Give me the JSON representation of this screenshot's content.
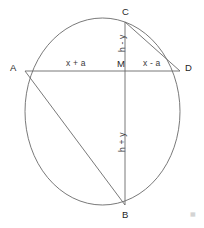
{
  "figure": {
    "stroke_color": "#555555",
    "background_color": "#ffffff",
    "label_color": "#2b2b2b",
    "vertices": [
      {
        "id": "A",
        "label": "A",
        "x": 25,
        "y": 71
      },
      {
        "id": "C",
        "label": "C",
        "x": 125,
        "y": 22
      },
      {
        "id": "D",
        "label": "D",
        "x": 180,
        "y": 71
      },
      {
        "id": "M",
        "label": "M",
        "x": 125,
        "y": 71
      },
      {
        "id": "B",
        "label": "B",
        "x": 125,
        "y": 205
      }
    ],
    "segments": [
      {
        "id": "AD",
        "from": "A",
        "to": "D"
      },
      {
        "id": "CB",
        "from": "C",
        "to": "B"
      },
      {
        "id": "AB",
        "from": "A",
        "to": "B"
      },
      {
        "id": "CD",
        "from": "C",
        "to": "D"
      }
    ],
    "segment_labels": [
      {
        "id": "AM",
        "text": "x + a",
        "orientation": "horizontal"
      },
      {
        "id": "MD",
        "text": "x - a",
        "orientation": "horizontal"
      },
      {
        "id": "MC",
        "text": "h - y",
        "orientation": "vertical"
      },
      {
        "id": "MB",
        "text": "h + y",
        "orientation": "vertical"
      }
    ],
    "circle": {
      "cx": 102.5,
      "cy": 111.5,
      "rx": 77.5,
      "ry": 93.5
    },
    "watermark": "▦"
  }
}
